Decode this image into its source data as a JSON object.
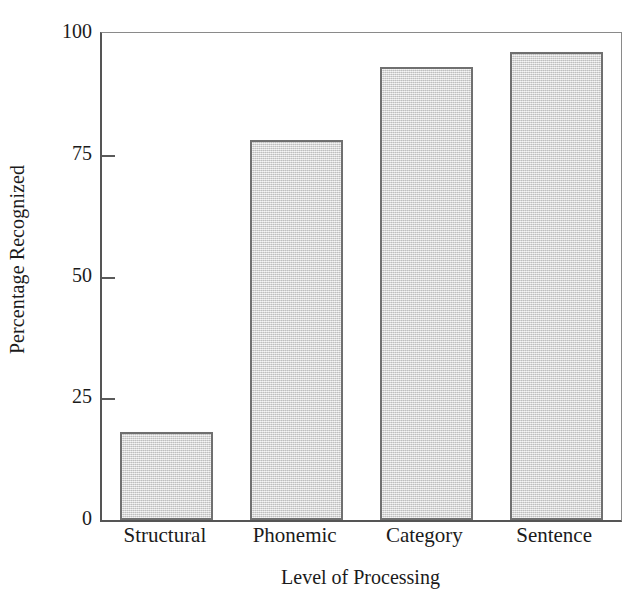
{
  "chart_data": {
    "type": "bar",
    "title": "",
    "subtitle": "",
    "xlabel": "Level of Processing",
    "ylabel": "Percentage Recognized",
    "categories": [
      "Structural",
      "Phonemic",
      "Category",
      "Sentence"
    ],
    "values": [
      18,
      78,
      93,
      96
    ],
    "series": [
      {
        "name": "Percentage Recognized",
        "values": [
          18,
          78,
          93,
          96
        ]
      }
    ],
    "ylim": [
      0,
      100
    ],
    "yticks": [
      0,
      25,
      50,
      75,
      100
    ],
    "ytick_labels": [
      "0",
      "25",
      "50",
      "75",
      "100"
    ],
    "xtick_labels": [
      "Structural",
      "Phonemic",
      "Category",
      "Sentence"
    ],
    "grid": false,
    "legend": false,
    "legend_position": "none",
    "annotations": [],
    "colors": {
      "bar_fill": "#d6d6d6",
      "bar_border": "#707070",
      "axis": "#555555",
      "frame": "#8a8a8a",
      "text": "#1b1b1b",
      "background": "#ffffff"
    }
  },
  "axes": {
    "y_title": "Percentage Recognized",
    "x_title": "Level of Processing",
    "y_ticks": [
      {
        "label": "100",
        "value": 100
      },
      {
        "label": "75",
        "value": 75
      },
      {
        "label": "50",
        "value": 50
      },
      {
        "label": "25",
        "value": 25
      },
      {
        "label": "0",
        "value": 0
      }
    ]
  },
  "bars": [
    {
      "label": "Structural",
      "value": 18
    },
    {
      "label": "Phonemic",
      "value": 78
    },
    {
      "label": "Category",
      "value": 93
    },
    {
      "label": "Sentence",
      "value": 96
    }
  ]
}
